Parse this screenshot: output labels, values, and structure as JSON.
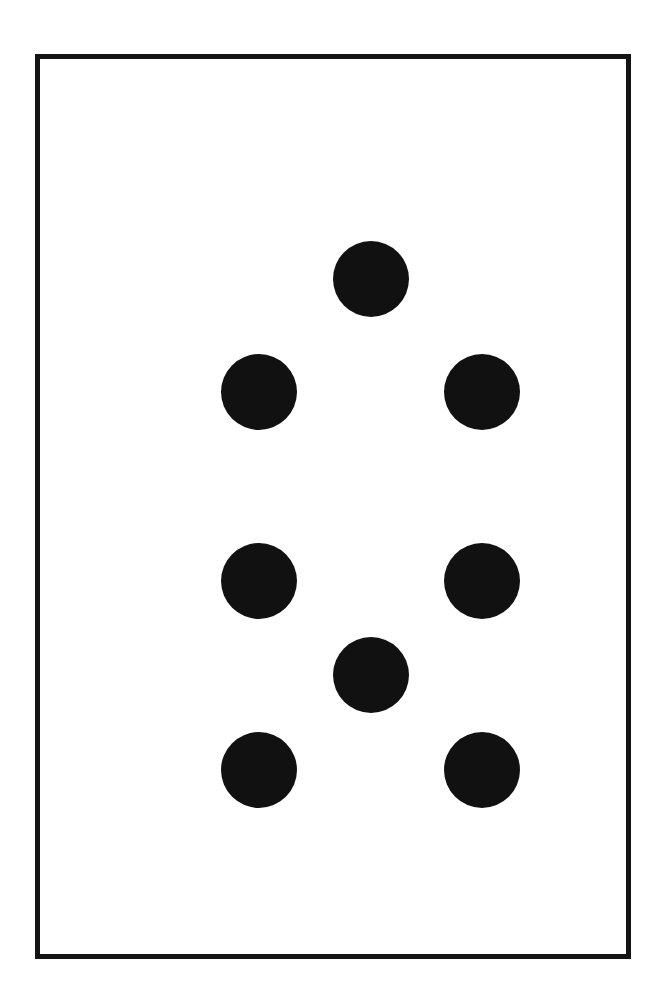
{
  "card": {
    "border_color": "#141414",
    "pip_color": "#111111",
    "pip_count": 8,
    "pips": [
      {
        "x": 371,
        "y": 279
      },
      {
        "x": 259,
        "y": 392
      },
      {
        "x": 482,
        "y": 392
      },
      {
        "x": 259,
        "y": 581
      },
      {
        "x": 482,
        "y": 581
      },
      {
        "x": 371,
        "y": 675
      },
      {
        "x": 259,
        "y": 770
      },
      {
        "x": 482,
        "y": 770
      }
    ]
  }
}
